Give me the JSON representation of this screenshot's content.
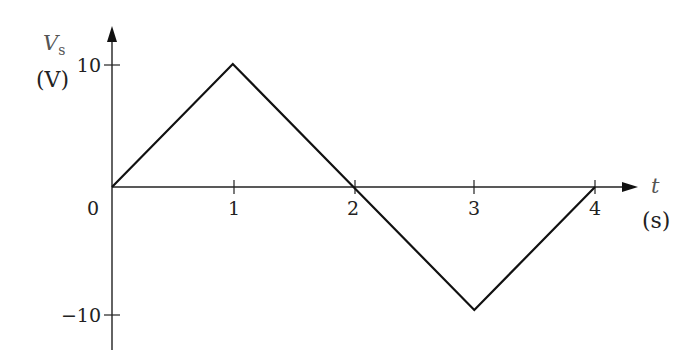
{
  "chart_data": {
    "type": "line",
    "title": "",
    "xlabel": "t",
    "xunit": "(s)",
    "ylabel": "V",
    "ylabel_subscript": "s",
    "yunit": "(V)",
    "x": [
      0,
      1,
      2,
      3,
      4
    ],
    "series": [
      {
        "name": "Vs",
        "values": [
          0,
          10,
          0,
          -10,
          0
        ]
      }
    ],
    "xticks": [
      1,
      2,
      3,
      4
    ],
    "xtick_labels": [
      "1",
      "2",
      "3",
      "4"
    ],
    "yticks": [
      10,
      -10
    ],
    "ytick_labels": [
      "10",
      "−10"
    ],
    "origin_label": "0",
    "xlim": [
      0,
      4.35
    ],
    "ylim": [
      -13,
      13
    ],
    "grid": false,
    "legend": "none",
    "line_color": "#111111"
  }
}
